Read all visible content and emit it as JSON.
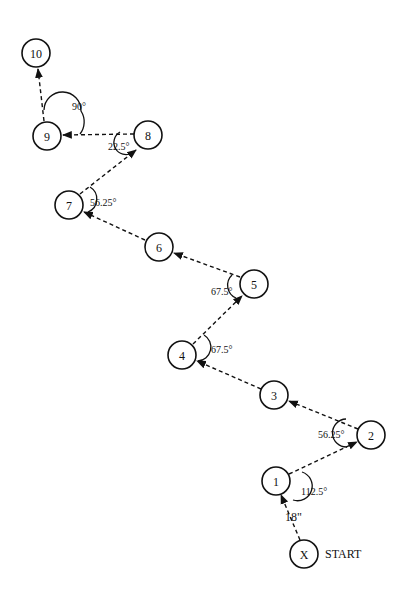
{
  "diagram": {
    "nodes": [
      {
        "id": "X",
        "label": "X",
        "x": 304,
        "y": 554
      },
      {
        "id": "1",
        "label": "1",
        "x": 276,
        "y": 481
      },
      {
        "id": "2",
        "label": "2",
        "x": 371,
        "y": 435
      },
      {
        "id": "3",
        "label": "3",
        "x": 274,
        "y": 395
      },
      {
        "id": "4",
        "label": "4",
        "x": 182,
        "y": 355
      },
      {
        "id": "5",
        "label": "5",
        "x": 254,
        "y": 284
      },
      {
        "id": "6",
        "label": "6",
        "x": 159,
        "y": 247
      },
      {
        "id": "7",
        "label": "7",
        "x": 69,
        "y": 205
      },
      {
        "id": "8",
        "label": "8",
        "x": 148,
        "y": 135
      },
      {
        "id": "9",
        "label": "9",
        "x": 47,
        "y": 136
      },
      {
        "id": "10",
        "label": "10",
        "x": 36,
        "y": 53
      }
    ],
    "start_label": "START",
    "distance_label": "18\"",
    "angles": [
      {
        "at": "1",
        "label": "112.5°"
      },
      {
        "at": "2",
        "label": "56.25°"
      },
      {
        "at": "4",
        "label": "67.5°"
      },
      {
        "at": "5",
        "label": "67.5°"
      },
      {
        "at": "7",
        "label": "56.25°"
      },
      {
        "at": "8",
        "label": "22.5°"
      },
      {
        "at": "9",
        "label": "90°"
      }
    ]
  }
}
